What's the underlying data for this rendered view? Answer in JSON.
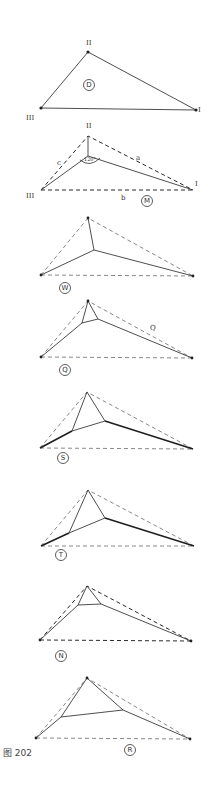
{
  "caption": "图 202",
  "figures": [
    {
      "id": "D",
      "label": "D",
      "vertex_labels": {
        "top": "II",
        "left": "III",
        "right": "I"
      }
    },
    {
      "id": "M",
      "label": "M",
      "vertex_labels": {
        "top": "II",
        "left": "III",
        "right": "I"
      },
      "side_labels": {
        "a": "a",
        "b": "b",
        "c": "c"
      },
      "angle_label": "120°"
    },
    {
      "id": "W",
      "label": "W"
    },
    {
      "id": "Q",
      "label": "Q",
      "side_label": "Q"
    },
    {
      "id": "S",
      "label": "S"
    },
    {
      "id": "T",
      "label": "T"
    },
    {
      "id": "N",
      "label": "N"
    },
    {
      "id": "R",
      "label": "R"
    }
  ]
}
